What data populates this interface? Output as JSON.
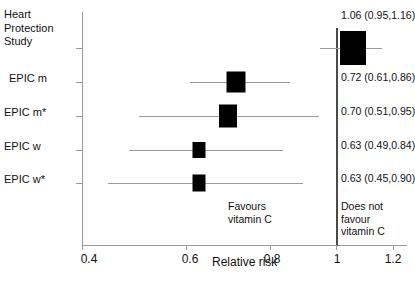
{
  "chart_data": {
    "type": "forest",
    "title": "",
    "xlabel": "Relative risk",
    "ylabel": "",
    "xlim": [
      0.35,
      1.27
    ],
    "xticks": [
      0.4,
      0.6,
      0.8,
      1,
      1.2
    ],
    "xtick_labels": [
      "0.4",
      "0.6",
      "0.8",
      "1",
      "1.2"
    ],
    "null_value": 1,
    "grid": false,
    "legend": "none",
    "categories": [
      "Heart Protection Study",
      "EPIC m",
      "EPIC m*",
      "EPIC w",
      "EPIC w*"
    ],
    "values": [
      1.06,
      0.72,
      0.7,
      0.63,
      0.63
    ],
    "ci_lower": [
      0.95,
      0.61,
      0.51,
      0.49,
      0.45
    ],
    "ci_upper": [
      1.16,
      0.86,
      0.95,
      0.84,
      0.9
    ],
    "rows": [
      {
        "label": "Heart\nProtection\nStudy",
        "label_top": 8,
        "estimate": 1.06,
        "ci_low": 0.95,
        "ci_high": 1.16,
        "estimate_text": "1.06 (0.95,1.16)",
        "box_w": 26,
        "box_h": 34
      },
      {
        "label": "EPIC m",
        "label_top": 72,
        "estimate": 0.72,
        "ci_low": 0.61,
        "ci_high": 0.86,
        "estimate_text": "0.72 (0.61,0.86)",
        "box_w": 19,
        "box_h": 21
      },
      {
        "label": "EPIC m*",
        "label_top": 106,
        "estimate": 0.7,
        "ci_low": 0.51,
        "ci_high": 0.95,
        "estimate_text": "0.70 (0.51,0.95)",
        "box_w": 18,
        "box_h": 23
      },
      {
        "label": "EPIC w",
        "label_top": 140,
        "estimate": 0.63,
        "ci_low": 0.49,
        "ci_high": 0.84,
        "estimate_text": "0.63 (0.49,0.84)",
        "box_w": 13,
        "box_h": 16
      },
      {
        "label": "EPIC w*",
        "label_top": 173,
        "estimate": 0.63,
        "ci_low": 0.45,
        "ci_high": 0.9,
        "estimate_text": "0.63 (0.45,0.90)",
        "box_w": 13,
        "box_h": 17
      }
    ],
    "annotations": {
      "favours": "Favours\nvitamin C",
      "not_favours": "Does not favour\nvitamin C"
    }
  }
}
